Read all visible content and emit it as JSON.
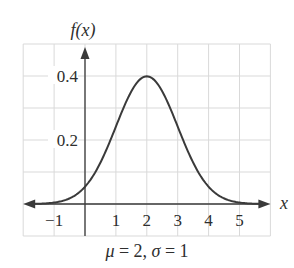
{
  "chart_data": {
    "type": "line",
    "title": "",
    "function": "normal pdf",
    "parameters": {
      "mu": 2,
      "sigma": 1
    },
    "xlabel": "x",
    "ylabel": "f(x)",
    "caption": {
      "mu_symbol": "μ",
      "sigma_symbol": "σ",
      "text_part1": " = 2, ",
      "text_part2": " = 1"
    },
    "xlim": [
      -2,
      6
    ],
    "ylim": [
      -0.1,
      0.5
    ],
    "x_ticks": [
      -1,
      1,
      2,
      3,
      4,
      5
    ],
    "x_tick_labels": [
      "−1",
      "1",
      "2",
      "3",
      "4",
      "5"
    ],
    "y_ticks": [
      0.2,
      0.4
    ],
    "y_tick_labels": [
      "0.2",
      "0.4"
    ],
    "grid": true,
    "grid_x_step": 1,
    "grid_y_step": 0.1,
    "x": [
      -2,
      -1.5,
      -1,
      -0.5,
      0,
      0.5,
      1,
      1.5,
      2,
      2.5,
      3,
      3.5,
      4,
      4.5,
      5,
      5.5,
      6
    ],
    "values": [
      0.0001,
      0.0009,
      0.0044,
      0.0175,
      0.054,
      0.1295,
      0.242,
      0.3521,
      0.3989,
      0.3521,
      0.242,
      0.1295,
      0.054,
      0.0175,
      0.0044,
      0.0009,
      0.0001
    ],
    "colors": {
      "curve": "#3a3a3a",
      "axis": "#3a3a3a",
      "grid": "#d9d9d9"
    }
  }
}
